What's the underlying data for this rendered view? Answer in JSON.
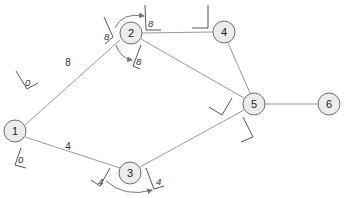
{
  "diagram": {
    "type": "network-graph",
    "nodes": [
      {
        "id": "1",
        "label": "1",
        "x": 15,
        "y": 131
      },
      {
        "id": "2",
        "label": "2",
        "x": 131,
        "y": 33
      },
      {
        "id": "3",
        "label": "3",
        "x": 130,
        "y": 173
      },
      {
        "id": "4",
        "label": "4",
        "x": 224,
        "y": 32
      },
      {
        "id": "5",
        "label": "5",
        "x": 254,
        "y": 104
      },
      {
        "id": "6",
        "label": "6",
        "x": 329,
        "y": 104
      }
    ],
    "edges": [
      {
        "from": "1",
        "to": "2",
        "weight": "8"
      },
      {
        "from": "1",
        "to": "3",
        "weight": "4"
      },
      {
        "from": "2",
        "to": "4",
        "weight": ""
      },
      {
        "from": "2",
        "to": "5",
        "weight": ""
      },
      {
        "from": "3",
        "to": "5",
        "weight": ""
      },
      {
        "from": "4",
        "to": "5",
        "weight": ""
      },
      {
        "from": "5",
        "to": "6",
        "weight": ""
      }
    ],
    "markers": [
      {
        "near": "1",
        "edge": "1-2",
        "value": "0"
      },
      {
        "near": "1",
        "edge": "1-3",
        "value": "0"
      },
      {
        "near": "2",
        "edge": "1-2",
        "value": "8"
      },
      {
        "near": "2",
        "edge": "2-4",
        "value": "8"
      },
      {
        "near": "2",
        "edge": "2-5",
        "value": "8"
      },
      {
        "near": "3",
        "edge": "1-3",
        "value": "4"
      },
      {
        "near": "3",
        "edge": "3-5",
        "value": "4"
      },
      {
        "near": "4",
        "edge": "2-4",
        "value": ""
      },
      {
        "near": "5",
        "edge": "2-5",
        "value": ""
      },
      {
        "near": "5",
        "edge": "3-5",
        "value": ""
      }
    ]
  }
}
